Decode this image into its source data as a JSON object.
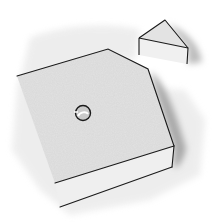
{
  "illustration": {
    "subject": "pentagonal slab with a hole and a separate triangular wedge",
    "colors": {
      "background": "#ffffff",
      "wash": "#d9d9d9",
      "wash_dark": "#bdbdbd",
      "top_face": "#e4e4e4",
      "front_face": "#eeeeee",
      "side_shadow": "#9e9e9e",
      "line": "#1a1a1a",
      "hole_fill": "#c8c8c8"
    },
    "slab": {
      "top_face_points": "17,76 108,49 148,69 174,146 55,183",
      "front_face_points": "55,183 174,146 172,167 60,207",
      "hole": {
        "cx": 83,
        "cy": 113,
        "r": 8
      }
    },
    "wedge": {
      "top_face_points": "139,38 165,20 188,48",
      "front_face_points": "139,38 188,48 187,64 139,55"
    }
  }
}
